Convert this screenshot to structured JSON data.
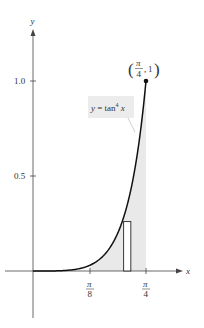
{
  "chart_data": {
    "type": "line",
    "title": "",
    "function_label": "y = tan⁴ x",
    "function_label_parts": {
      "lhs": "y = tan",
      "exp": "4",
      "rhs": "x"
    },
    "xlabel": "x",
    "ylabel": "y",
    "x_ticks": [
      {
        "value": 0.3927,
        "num": "π",
        "den": "8"
      },
      {
        "value": 0.7854,
        "num": "π",
        "den": "4"
      }
    ],
    "y_ticks": [
      {
        "value": 0.5,
        "label": "0.5"
      },
      {
        "value": 1.0,
        "label": "1.0"
      }
    ],
    "xlim": [
      0,
      0.7854
    ],
    "ylim": [
      0,
      1.0
    ],
    "grid": false,
    "series": [
      {
        "name": "y = tan^4 x",
        "x": [
          0,
          0.1,
          0.2,
          0.3,
          0.3927,
          0.45,
          0.5,
          0.55,
          0.6,
          0.65,
          0.7,
          0.75,
          0.7854
        ],
        "y": [
          0,
          0.0001,
          0.0017,
          0.0091,
          0.0294,
          0.0548,
          0.0892,
          0.1392,
          0.2089,
          0.3089,
          0.4527,
          0.6638,
          1.0
        ]
      }
    ],
    "shaded_region": {
      "from": 0.3927,
      "to": 0.7854,
      "description": "area under curve"
    },
    "representative_rectangle": {
      "x_left": 0.63,
      "x_right": 0.68,
      "height": 0.26
    },
    "annotations": [
      {
        "point": [
          0.7854,
          1.0
        ],
        "num": "π",
        "den": "4",
        "y_text": "1"
      }
    ]
  }
}
